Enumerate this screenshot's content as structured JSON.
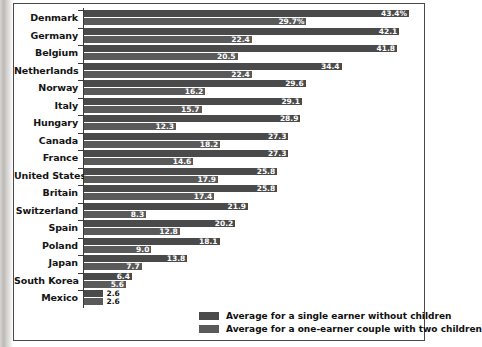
{
  "chart_data": {
    "type": "bar",
    "orientation": "horizontal",
    "title": "",
    "xlabel": "",
    "ylabel": "",
    "xlim": [
      0,
      43.4
    ],
    "grid": false,
    "legend_position": "bottom-right",
    "categories": [
      "Denmark",
      "Germany",
      "Belgium",
      "Netherlands",
      "Norway",
      "Italy",
      "Hungary",
      "Canada",
      "France",
      "United States",
      "Britain",
      "Switzerland",
      "Spain",
      "Poland",
      "Japan",
      "South Korea",
      "Mexico"
    ],
    "series": [
      {
        "name": "Average for a single earner without children",
        "color": "#4a4a4a",
        "values": [
          43.4,
          42.1,
          41.8,
          34.4,
          29.6,
          29.1,
          28.9,
          27.3,
          27.3,
          25.8,
          25.8,
          21.9,
          20.2,
          18.1,
          13.8,
          6.4,
          2.6
        ],
        "labels": [
          "43.4%",
          "42.1",
          "41.8",
          "34.4",
          "29.6",
          "29.1",
          "28.9",
          "27.3",
          "27.3",
          "25.8",
          "25.8",
          "21.9",
          "20.2",
          "18.1",
          "13.8",
          "6.4",
          "2.6"
        ]
      },
      {
        "name": "Average for a one-earner couple with two children",
        "color": "#5a5a5a",
        "values": [
          29.7,
          22.4,
          20.5,
          22.4,
          16.2,
          15.7,
          12.3,
          18.2,
          14.6,
          17.9,
          17.4,
          8.3,
          12.8,
          9.0,
          7.7,
          5.6,
          2.6
        ],
        "labels": [
          "29.7%",
          "22.4",
          "20.5",
          "22.4",
          "16.2",
          "15.7",
          "12.3",
          "18.2",
          "14.6",
          "17.9",
          "17.4",
          "8.3",
          "12.8",
          "9.0",
          "7.7",
          "5.6",
          "2.6"
        ]
      }
    ]
  },
  "legend": {
    "items": [
      {
        "label": "Average for a single earner without children",
        "color": "#4a4a4a"
      },
      {
        "label": "Average for a one-earner couple with two children",
        "color": "#5a5a5a"
      }
    ]
  }
}
